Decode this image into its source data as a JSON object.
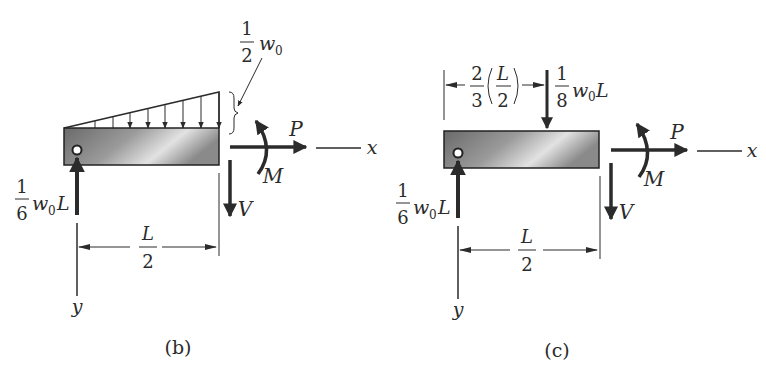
{
  "figures": [
    {
      "id": "b",
      "caption": "(b)",
      "distributed_load_label": {
        "num": "1",
        "den": "2",
        "symbol": "w",
        "subscript": "0"
      },
      "reaction_label": {
        "num": "1",
        "den": "6",
        "symbol": "w",
        "subscript": "0",
        "suffix": "L"
      },
      "dimension_label": {
        "num": "L",
        "den": "2"
      },
      "axial_force": "P",
      "moment": "M",
      "shear": "V",
      "x_axis": "x",
      "y_axis": "y"
    },
    {
      "id": "c",
      "caption": "(c)",
      "resultant_position_label": {
        "coef_num": "2",
        "coef_den": "3",
        "inner_num": "L",
        "inner_den": "2"
      },
      "resultant_label": {
        "num": "1",
        "den": "8",
        "symbol": "w",
        "subscript": "0",
        "suffix": "L"
      },
      "reaction_label": {
        "num": "1",
        "den": "6",
        "symbol": "w",
        "subscript": "0",
        "suffix": "L"
      },
      "dimension_label": {
        "num": "L",
        "den": "2"
      },
      "axial_force": "P",
      "moment": "M",
      "shear": "V",
      "x_axis": "x",
      "y_axis": "y"
    }
  ],
  "colors": {
    "ink": "#2b2b2b",
    "beam_dark": "#6e6e6e",
    "beam_light": "#e6e6e6",
    "outline": "#222222"
  }
}
